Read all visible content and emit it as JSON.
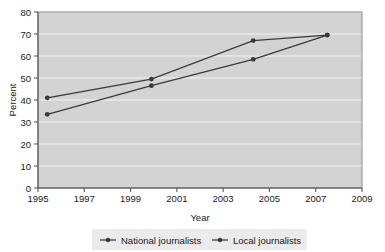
{
  "chart_data": {
    "type": "line",
    "title": "",
    "xlabel": "Year",
    "ylabel": "Percent",
    "xlim": [
      1995,
      2009
    ],
    "ylim": [
      0,
      80
    ],
    "xticks": [
      1995,
      1997,
      1999,
      2001,
      2003,
      2005,
      2007,
      2009
    ],
    "yticks": [
      0,
      10,
      20,
      30,
      40,
      50,
      60,
      70,
      80
    ],
    "xtick_labels": [
      "1995",
      "1997",
      "1999",
      "2001",
      "2003",
      "2005",
      "2007",
      "2009"
    ],
    "ytick_labels": [
      "0",
      "10",
      "20",
      "30",
      "40",
      "50",
      "60",
      "70",
      "80"
    ],
    "grid": "horizontal",
    "legend_position": "bottom",
    "series": [
      {
        "name": "National journalists",
        "x": [
          1995.4,
          1999.9,
          2004.3,
          2007.5
        ],
        "values": [
          41.0,
          49.5,
          67.0,
          69.5
        ]
      },
      {
        "name": "Local journalists",
        "x": [
          1995.4,
          1999.9,
          2004.3,
          2007.5
        ],
        "values": [
          33.5,
          46.5,
          58.5,
          69.5
        ]
      }
    ]
  },
  "axes": {
    "y_title": "Percent",
    "x_title": "Year"
  },
  "legend": {
    "items": [
      {
        "label": "National journalists",
        "marker": "line-dot-marker"
      },
      {
        "label": "Local journalists",
        "marker": "line-dot-marker"
      }
    ]
  },
  "ticks": {
    "y": [
      "80",
      "70",
      "60",
      "50",
      "40",
      "30",
      "20",
      "10",
      "0"
    ],
    "x": [
      "1995",
      "1997",
      "1999",
      "2001",
      "2003",
      "2005",
      "2007",
      "2009"
    ]
  },
  "colors": {
    "plot_background": "#d3d3d3",
    "gridline": "#f2f2f2",
    "series_stroke": "#3a3a3a",
    "legend_background": "#ebebeb",
    "text": "#1a1a1a"
  }
}
